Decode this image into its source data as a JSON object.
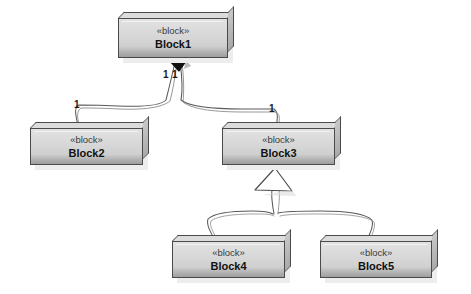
{
  "diagram": {
    "type": "sysml-block-definition-diagram",
    "style": "hand-drawn",
    "background_color": "#ffffff",
    "width": 471,
    "height": 294,
    "node_fill_color": "#d5d5d5",
    "node_border_color": "#4a4a4a",
    "edge_color": "#5a5a5a"
  },
  "nodes": [
    {
      "id": "block1",
      "stereotype": "«block»",
      "name": "Block1",
      "x": 118,
      "y": 18,
      "width": 110,
      "height": 40
    },
    {
      "id": "block2",
      "stereotype": "«block»",
      "name": "Block2",
      "x": 30,
      "y": 128,
      "width": 113,
      "height": 37
    },
    {
      "id": "block3",
      "stereotype": "«block»",
      "name": "Block3",
      "x": 222,
      "y": 128,
      "width": 113,
      "height": 37
    },
    {
      "id": "block4",
      "stereotype": "«block»",
      "name": "Block4",
      "x": 172,
      "y": 241,
      "width": 113,
      "height": 37
    },
    {
      "id": "block5",
      "stereotype": "«block»",
      "name": "Block5",
      "x": 320,
      "y": 241,
      "width": 112,
      "height": 37
    }
  ],
  "edges": [
    {
      "id": "composition-block1-block2",
      "kind": "composition",
      "source": "block1",
      "target": "block2",
      "source_decoration": "filled-diamond",
      "source_multiplicity": "1",
      "target_multiplicity": "1"
    },
    {
      "id": "composition-block1-block3",
      "kind": "composition",
      "source": "block1",
      "target": "block3",
      "source_decoration": "filled-diamond",
      "source_multiplicity": "1",
      "target_multiplicity": "1"
    },
    {
      "id": "generalization-block4-block3",
      "kind": "generalization",
      "source": "block4",
      "target": "block3",
      "target_decoration": "hollow-triangle"
    },
    {
      "id": "generalization-block5-block3",
      "kind": "generalization",
      "source": "block5",
      "target": "block3",
      "target_decoration": "hollow-triangle"
    }
  ],
  "multiplicity_labels": [
    {
      "id": "mult-block1-left",
      "text": "1",
      "x": 163,
      "y": 70
    },
    {
      "id": "mult-block1-right",
      "text": "1",
      "x": 172,
      "y": 70
    },
    {
      "id": "mult-block2",
      "text": "1",
      "x": 74,
      "y": 100
    },
    {
      "id": "mult-block3",
      "text": "1",
      "x": 269,
      "y": 104
    }
  ]
}
